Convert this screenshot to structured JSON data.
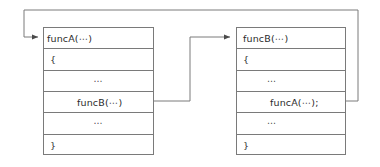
{
  "diagram": {
    "line_color": "#7a7a7a",
    "text_color": "#2b2b2b",
    "background": "#ffffff",
    "boxes": [
      {
        "id": "funcA",
        "name": "funcA",
        "rows": [
          {
            "text": "funcA(⋯)",
            "align": "left"
          },
          {
            "text": "{",
            "align": "left"
          },
          {
            "text": "⋯",
            "align": "center"
          },
          {
            "text": "funcB(⋯)",
            "align": "indent"
          },
          {
            "text": "⋯",
            "align": "center"
          },
          {
            "text": "}",
            "align": "left"
          }
        ]
      },
      {
        "id": "funcB",
        "name": "funcB",
        "rows": [
          {
            "text": "funcB(⋯)",
            "align": "left"
          },
          {
            "text": "{",
            "align": "left"
          },
          {
            "text": "⋯",
            "align": "center"
          },
          {
            "text": "funcA(⋯);",
            "align": "indent"
          },
          {
            "text": "⋯",
            "align": "center"
          },
          {
            "text": "}",
            "align": "left"
          }
        ]
      }
    ],
    "connectors": [
      {
        "id": "funcA-calls-funcB",
        "from": "funcA-row-call",
        "to": "funcB-header",
        "arrowhead": "right"
      },
      {
        "id": "funcB-calls-funcA",
        "from": "funcB-row-call",
        "to": "funcA-header",
        "arrowhead": "right"
      }
    ]
  }
}
